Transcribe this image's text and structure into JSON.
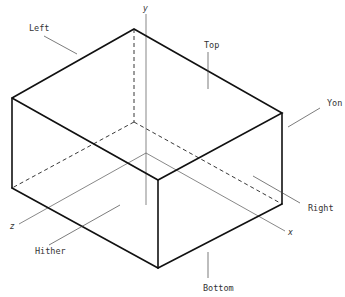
{
  "diagram": {
    "type": "isometric-box-view-volume",
    "labels": {
      "left": "Left",
      "top": "Top",
      "yon": "Yon",
      "right": "Right",
      "hither": "Hither",
      "bottom": "Bottom"
    },
    "axes": {
      "x": "x",
      "y": "y",
      "z": "z"
    }
  }
}
